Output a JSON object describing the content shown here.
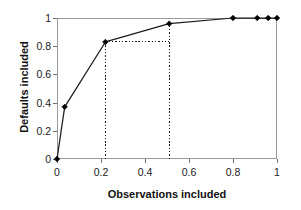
{
  "chart_data": {
    "type": "line",
    "title": "",
    "subtitle": "",
    "xlabel": "Observations included",
    "ylabel": "Defaults included",
    "xlim": [
      0,
      1
    ],
    "ylim": [
      0,
      1
    ],
    "xticks": [
      "0",
      "0.2",
      "0.4",
      "0.6",
      "0.8",
      "1"
    ],
    "xtick_values": [
      0,
      0.2,
      0.4,
      0.6,
      0.8,
      1
    ],
    "yticks": [
      "0",
      "0.2",
      "0.4",
      "0.6",
      "0.8",
      "1"
    ],
    "ytick_values": [
      0,
      0.2,
      0.4,
      0.6,
      0.8,
      1
    ],
    "grid": false,
    "legend": null,
    "legend_position": "none",
    "marker": "diamond",
    "line_color": "#1a1a1a",
    "marker_color": "#000000",
    "frame_color": "#9a9a9a",
    "series": [
      {
        "name": "Cumulative accuracy profile",
        "x": [
          0,
          0.035,
          0.22,
          0.51,
          0.8,
          0.91,
          0.96,
          1.0
        ],
        "values": [
          0,
          0.37,
          0.83,
          0.96,
          1.0,
          1.0,
          1.0,
          1.0
        ]
      }
    ],
    "annotations": [
      {
        "name": "vertical-guide-left",
        "type": "dotted-line",
        "orientation": "vertical",
        "x": 0.22,
        "y_from": 0,
        "y_to": 0.83
      },
      {
        "name": "horizontal-guide",
        "type": "dotted-line",
        "orientation": "horizontal",
        "y": 0.83,
        "x_from": 0.22,
        "x_to": 0.51
      },
      {
        "name": "vertical-guide-right",
        "type": "dotted-line",
        "orientation": "vertical",
        "x": 0.51,
        "y_from": 0,
        "y_to": 0.96
      }
    ]
  }
}
